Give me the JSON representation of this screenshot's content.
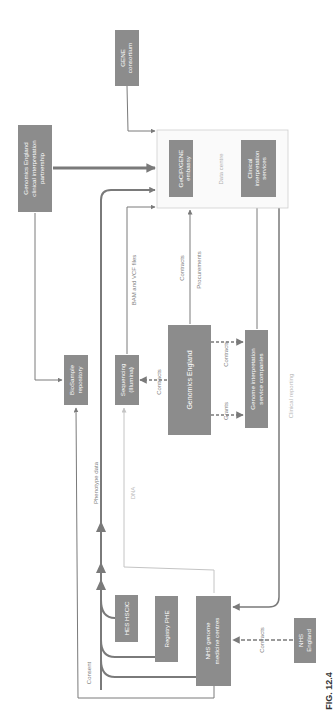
{
  "figure_label": "FIG. 12.4",
  "colors": {
    "node_fill": "#8c8c8c",
    "node_text": "#ffffff",
    "edge": "#7a7a7a",
    "edge_light": "#c4c4c4",
    "container_border": "#cfcfcf",
    "label": "#808080"
  },
  "nodes": {
    "gene_consortium": [
      "GENE",
      "consortium"
    ],
    "ge_partnership": [
      "Genomics England",
      "clinical interpretation",
      "partnership"
    ],
    "data_centre": "Data centre",
    "gecip_embassy": [
      "GeCIP/GENE",
      "embassy"
    ],
    "clinical_services": [
      "Clinical",
      "interpretation",
      "services"
    ],
    "biosample": [
      "BioSample",
      "repository"
    ],
    "sequencing": [
      "Sequencing",
      "(Illumina)"
    ],
    "genomics_england": "Genomics England",
    "genome_companies": [
      "Genome interpretation",
      "service companies"
    ],
    "hes_hscic": "HES HSCIC",
    "registry_phe": "Registry PHE",
    "nhs_centres": [
      "NHS genome",
      "medicine centres"
    ],
    "nhs_england": [
      "NHS",
      "England"
    ]
  },
  "edge_labels": {
    "bam_vcf": "BAM and VCF files",
    "contracts_dc": "Contracts",
    "procurements": "Procurements",
    "contracts_seq": "Contracts",
    "contracts_companies": "Contracts",
    "grants": "Grants",
    "clinical_reporting": "Clinical reporting",
    "phenotype": "Phenotype data",
    "dna": "DNA",
    "consent": "Consent",
    "contracts_nhs": "Contracts"
  }
}
